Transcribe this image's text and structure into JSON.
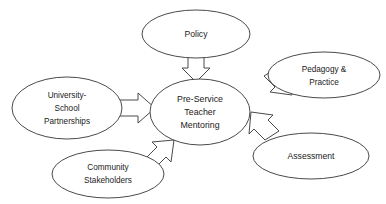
{
  "diagram": {
    "background_color": "#ffffff",
    "stroke_color": "#4a4a4a",
    "text_color": "#1a1a1a",
    "center_node": {
      "id": "center",
      "label": "Pre-Service Teacher Mentoring",
      "lines": [
        "Pre-Service",
        "Teacher",
        "Mentoring"
      ],
      "shape": "ellipse",
      "cx": 200,
      "cy": 112,
      "rx": 50,
      "ry": 33
    },
    "nodes": [
      {
        "id": "policy",
        "label": "Policy",
        "lines": [
          "Policy"
        ],
        "shape": "ellipse",
        "cx": 196,
        "cy": 34,
        "rx": 54,
        "ry": 24,
        "position": "top"
      },
      {
        "id": "pedagogy-practice",
        "label": "Pedagogy & Practice",
        "lines": [
          "Pedagogy &",
          "Practice"
        ],
        "shape": "ellipse",
        "cx": 324,
        "cy": 75,
        "rx": 56,
        "ry": 23,
        "position": "top-right"
      },
      {
        "id": "assessment",
        "label": "Assessment",
        "lines": [
          "Assessment"
        ],
        "shape": "ellipse",
        "cx": 311,
        "cy": 156,
        "rx": 58,
        "ry": 23,
        "position": "bottom-right"
      },
      {
        "id": "community-stakeholders",
        "label": "Community Stakeholders",
        "lines": [
          "Community",
          "Stakeholders"
        ],
        "shape": "ellipse",
        "cx": 108,
        "cy": 174,
        "rx": 56,
        "ry": 24,
        "position": "bottom-left"
      },
      {
        "id": "university-school-partnerships",
        "label": "University-School Partnerships",
        "lines": [
          "University-",
          "School",
          "Partnerships"
        ],
        "shape": "ellipse",
        "cx": 67,
        "cy": 108,
        "rx": 55,
        "ry": 31,
        "position": "left"
      }
    ],
    "arrows": [
      {
        "id": "arrow-policy-to-center",
        "from": "policy",
        "to": "center",
        "direction": "down",
        "style": "block-arrow"
      },
      {
        "id": "arrow-university-to-center",
        "from": "university-school-partnerships",
        "to": "center",
        "direction": "right",
        "style": "block-arrow"
      },
      {
        "id": "arrow-pedagogy-to-center",
        "from": "pedagogy-practice",
        "to": "center",
        "direction": "down-left",
        "style": "block-arrow"
      },
      {
        "id": "arrow-assessment-to-center",
        "from": "assessment",
        "to": "center",
        "direction": "up-left",
        "style": "block-arrow"
      },
      {
        "id": "arrow-community-to-center",
        "from": "community-stakeholders",
        "to": "center",
        "direction": "up-right",
        "style": "block-arrow"
      }
    ]
  }
}
